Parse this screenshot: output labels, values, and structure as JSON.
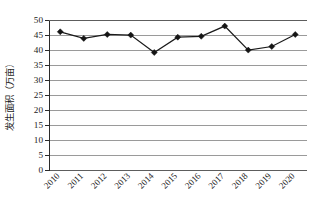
{
  "chart_data": {
    "type": "line",
    "title": "",
    "subtitle": "",
    "xlabel": "",
    "ylabel": "发生面积（万亩）",
    "categories": [
      "2010",
      "2011",
      "2012",
      "2013",
      "2014",
      "2015",
      "2016",
      "2017",
      "2018",
      "2019",
      "2020"
    ],
    "values": [
      45.9,
      43.7,
      45.0,
      44.8,
      39.0,
      44.1,
      44.4,
      47.8,
      39.8,
      41.0,
      45.0
    ],
    "series": [
      {
        "name": "发生面积",
        "values": [
          45.9,
          43.7,
          45.0,
          44.8,
          39.0,
          44.1,
          44.4,
          47.8,
          39.8,
          41.0,
          45.0
        ]
      }
    ],
    "ylim": [
      0,
      50
    ],
    "ytick_step": 5,
    "ytick_labels": [
      "0",
      "5",
      "10",
      "15",
      "20",
      "25",
      "30",
      "35",
      "40",
      "45",
      "50"
    ],
    "ytick_values": [
      0,
      5,
      10,
      15,
      20,
      25,
      30,
      35,
      40,
      45,
      50
    ],
    "grid": "horizontal",
    "legend": "none",
    "marker": "diamond",
    "xtick_rotation": 45,
    "colors": {
      "line": "#1b1b1b",
      "marker": "#151515",
      "gridline": "#9a9a9a",
      "axis": "#2b2b2b",
      "background": "#ffffff"
    }
  }
}
